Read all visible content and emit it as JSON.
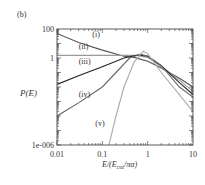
{
  "panel_label": "(b)",
  "chart_data": {
    "type": "line",
    "title": "",
    "xlabel": "E/(E_cut/πα)",
    "ylabel": "P(E)",
    "xscale": "log",
    "yscale": "log",
    "xlim": [
      0.01,
      10
    ],
    "ylim": [
      1e-06,
      100
    ],
    "x_ticks": [
      "0.01",
      "0.1",
      "1",
      "10"
    ],
    "y_ticks": [
      "1e-006",
      "1",
      "100"
    ],
    "grid": false,
    "legend": "inline curve labels",
    "series": [
      {
        "name": "(i)",
        "color": "#555555",
        "points": [
          [
            0.01,
            50
          ],
          [
            0.03,
            12
          ],
          [
            0.1,
            3.5
          ],
          [
            0.3,
            1.3
          ],
          [
            0.5,
            1.1
          ],
          [
            1,
            0.6
          ],
          [
            2,
            0.2
          ],
          [
            5,
            0.04
          ],
          [
            10,
            0.01
          ]
        ]
      },
      {
        "name": "(ii)",
        "color": "#999999",
        "points": [
          [
            0.01,
            1.5
          ],
          [
            0.1,
            1.5
          ],
          [
            0.3,
            1.5
          ],
          [
            0.6,
            1.5
          ],
          [
            1,
            1.1
          ],
          [
            2,
            0.25
          ],
          [
            5,
            0.03
          ],
          [
            10,
            0.005
          ]
        ]
      },
      {
        "name": "(iii)",
        "color": "#222222",
        "points": [
          [
            0.01,
            0.015
          ],
          [
            0.03,
            0.06
          ],
          [
            0.1,
            0.25
          ],
          [
            0.3,
            1.0
          ],
          [
            0.6,
            1.6
          ],
          [
            1,
            1.3
          ],
          [
            2,
            0.3
          ],
          [
            5,
            0.02
          ],
          [
            10,
            0.003
          ]
        ]
      },
      {
        "name": "(iv)",
        "color": "#666666",
        "points": [
          [
            0.01,
            0.0001
          ],
          [
            0.03,
            0.0008
          ],
          [
            0.1,
            0.01
          ],
          [
            0.2,
            0.1
          ],
          [
            0.4,
            1.0
          ],
          [
            0.7,
            1.8
          ],
          [
            1,
            1.4
          ],
          [
            2,
            0.3
          ],
          [
            5,
            0.01
          ],
          [
            10,
            0.002
          ]
        ]
      },
      {
        "name": "(v)",
        "color": "#aaaaaa",
        "points": [
          [
            0.14,
            1e-06
          ],
          [
            0.2,
            0.0001
          ],
          [
            0.3,
            0.01
          ],
          [
            0.5,
            0.5
          ],
          [
            0.8,
            3.0
          ],
          [
            1,
            2.0
          ],
          [
            2,
            0.1
          ],
          [
            5,
            0.003
          ],
          [
            10,
            0.0002
          ]
        ]
      }
    ],
    "annotations": [
      {
        "text": "(i)",
        "x": 0.06,
        "y": 30
      },
      {
        "text": "(ii)",
        "x": 0.03,
        "y": 4
      },
      {
        "text": "(iii)",
        "x": 0.03,
        "y": 0.4
      },
      {
        "text": "(iv)",
        "x": 0.03,
        "y": 0.002
      },
      {
        "text": "(v)",
        "x": 0.07,
        "y": 2e-05
      }
    ]
  }
}
